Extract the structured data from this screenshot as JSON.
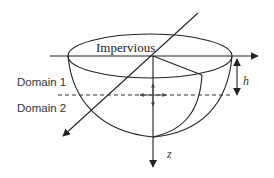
{
  "diagram": {
    "type": "3D hemispherical bowl domain schematic",
    "labels": {
      "top": "Impervious",
      "domain1": "Domain 1",
      "domain2": "Domain 2",
      "depth": "h",
      "vertical_axis": "z"
    },
    "colors": {
      "stroke": "#222222",
      "background": "#ffffff"
    }
  }
}
